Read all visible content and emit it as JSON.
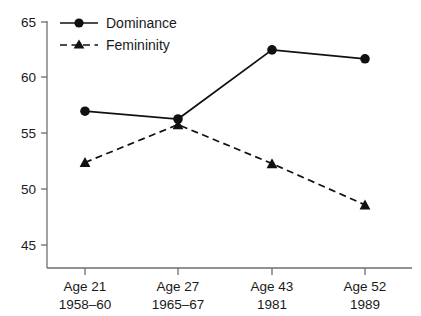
{
  "chart_data": {
    "type": "line",
    "title": "",
    "subtitle": "",
    "xlabel": "",
    "ylabel": "",
    "ylim": [
      45,
      65
    ],
    "yticks": [
      45,
      50,
      55,
      60,
      65
    ],
    "ytick_labels": [
      "45",
      "50",
      "55",
      "60",
      "65"
    ],
    "grid": false,
    "legend_position": "top-left",
    "categories": [
      "Age 21",
      "Age 27",
      "Age 43",
      "Age 52"
    ],
    "category_sublabels": [
      "1958–60",
      "1965–67",
      "1981",
      "1989"
    ],
    "series": [
      {
        "name": "Dominance",
        "values": [
          57.0,
          56.3,
          62.5,
          61.7
        ],
        "marker": "circle",
        "line_style": "solid",
        "color": "#111111"
      },
      {
        "name": "Femininity",
        "values": [
          52.4,
          55.8,
          52.3,
          48.6
        ],
        "marker": "triangle",
        "line_style": "dashed",
        "color": "#111111"
      }
    ]
  },
  "legend": {
    "items": [
      {
        "label": "Dominance",
        "marker": "circle",
        "line_style": "solid"
      },
      {
        "label": "Femininity",
        "marker": "triangle",
        "line_style": "dashed"
      }
    ]
  },
  "axes": {
    "y": {
      "labels": [
        "65",
        "60",
        "55",
        "50",
        "45"
      ]
    },
    "x": {
      "labels": [
        {
          "age": "Age 21",
          "years": "1958–60"
        },
        {
          "age": "Age 27",
          "years": "1965–67"
        },
        {
          "age": "Age 43",
          "years": "1981"
        },
        {
          "age": "Age 52",
          "years": "1989"
        }
      ]
    }
  },
  "colors": {
    "series": "#111111",
    "axis": "#6e6e6e",
    "text": "#1a1a1a",
    "background": "#ffffff"
  }
}
